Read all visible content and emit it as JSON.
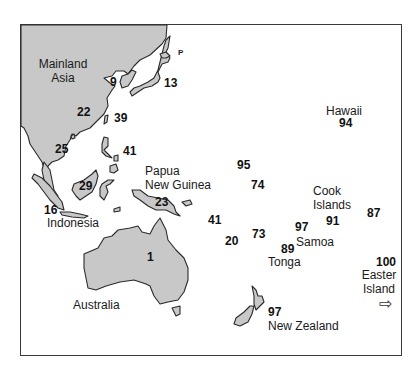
{
  "map": {
    "land_fill": "#c8c8c8",
    "outline": "#2a2a2a",
    "regions": [
      {
        "id": "mainland-asia",
        "label": "Mainland Asia",
        "label_lines": [
          "Mainland",
          "Asia"
        ]
      },
      {
        "id": "indonesia",
        "label": "Indonesia"
      },
      {
        "id": "papua-new-guinea",
        "label": "Papua New Guinea",
        "label_lines": [
          "Papua",
          "New Guinea"
        ]
      },
      {
        "id": "australia",
        "label": "Australia"
      },
      {
        "id": "new-zealand",
        "label": "New Zealand"
      },
      {
        "id": "hawaii",
        "label": "Hawaii"
      },
      {
        "id": "cook-islands",
        "label": "Cook Islands",
        "label_lines": [
          "Cook",
          "Islands"
        ]
      },
      {
        "id": "samoa",
        "label": "Samoa"
      },
      {
        "id": "tonga",
        "label": "Tonga"
      },
      {
        "id": "easter-island",
        "label": "Easter Island",
        "label_lines": [
          "Easter",
          "Island"
        ]
      }
    ],
    "small_mark": "P",
    "values": [
      {
        "id": "korea",
        "value": "9"
      },
      {
        "id": "japan",
        "value": "13"
      },
      {
        "id": "south-china",
        "value": "22"
      },
      {
        "id": "taiwan",
        "value": "39"
      },
      {
        "id": "vietnam",
        "value": "25"
      },
      {
        "id": "philippines",
        "value": "41"
      },
      {
        "id": "borneo",
        "value": "29"
      },
      {
        "id": "sumatra-java",
        "value": "16"
      },
      {
        "id": "new-guinea",
        "value": "23"
      },
      {
        "id": "australia",
        "value": "1"
      },
      {
        "id": "micronesia",
        "value": "95"
      },
      {
        "id": "melanesia-north",
        "value": "74"
      },
      {
        "id": "solomons",
        "value": "41"
      },
      {
        "id": "vanuatu",
        "value": "20"
      },
      {
        "id": "fiji",
        "value": "73"
      },
      {
        "id": "tonga",
        "value": "89"
      },
      {
        "id": "samoa",
        "value": "97"
      },
      {
        "id": "cook-islands",
        "value": "91"
      },
      {
        "id": "society-islands",
        "value": "87"
      },
      {
        "id": "hawaii",
        "value": "94"
      },
      {
        "id": "easter-island",
        "value": "100"
      },
      {
        "id": "new-zealand",
        "value": "97"
      }
    ],
    "arrow_glyph": "⇨"
  }
}
